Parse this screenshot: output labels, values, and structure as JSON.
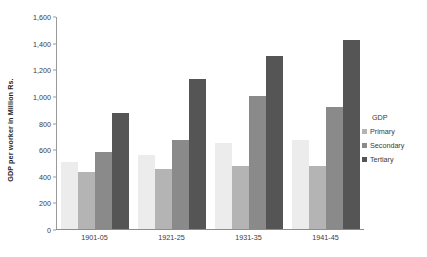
{
  "chart_data": {
    "type": "bar",
    "title": "",
    "subtitle": "",
    "xlabel": "",
    "ylabel": "GDP per worker in Million Rs.",
    "categories": [
      "1901-05",
      "1921-25",
      "1931-35",
      "1941-45"
    ],
    "series": [
      {
        "name": "",
        "values": [
          500,
          555,
          645,
          665
        ],
        "color": "#ececec"
      },
      {
        "name": "Primary",
        "values": [
          430,
          450,
          475,
          470
        ],
        "color": "#b4b4b4"
      },
      {
        "name": "Secondary",
        "values": [
          580,
          665,
          1000,
          915
        ],
        "color": "#8a8a8a"
      },
      {
        "name": "Tertiary",
        "values": [
          870,
          1125,
          1300,
          1420
        ],
        "color": "#555555"
      }
    ],
    "ylim": [
      0,
      1600
    ],
    "yticks": [
      "0",
      "200",
      "400",
      "600",
      "800",
      "1,000",
      "1,200",
      "1,400",
      "1,600"
    ],
    "ytick_values": [
      0,
      200,
      400,
      600,
      800,
      1000,
      1200,
      1400,
      1600
    ],
    "grid": false,
    "legend_position": "right",
    "legend_title": "GDP"
  },
  "legend": {
    "title": "GDP",
    "items": [
      {
        "label": "Primary"
      },
      {
        "label": "Secondary"
      },
      {
        "label": "Tertiary"
      }
    ]
  },
  "axes": {
    "y_title": "GDP per worker in Million Rs."
  }
}
